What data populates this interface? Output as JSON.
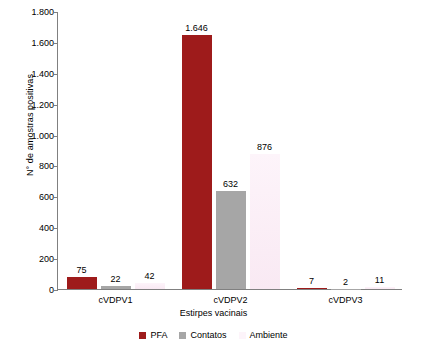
{
  "chart_data": {
    "type": "bar",
    "title": "",
    "xlabel": "Estirpes vacinais",
    "ylabel": "N° de amostras positivas",
    "categories": [
      "cVDPV1",
      "cVDPV2",
      "cVDPV3"
    ],
    "series": [
      {
        "name": "PFA",
        "color": "#9E1B1B",
        "values": [
          75,
          1646,
          7
        ],
        "labels": [
          "75",
          "1.646",
          "7"
        ]
      },
      {
        "name": "Contatos",
        "color": "#A6A6A6",
        "values": [
          22,
          632,
          2
        ],
        "labels": [
          "22",
          "632",
          "2"
        ]
      },
      {
        "name": "Ambiente",
        "color": "#FBEFF7",
        "values": [
          42,
          876,
          11
        ],
        "labels": [
          "42",
          "876",
          "11"
        ]
      }
    ],
    "ylim": [
      0,
      1800
    ],
    "yticks": [
      0,
      200,
      400,
      600,
      800,
      1000,
      1200,
      1400,
      1600,
      1800
    ],
    "ytick_labels": [
      "0",
      "200",
      "400",
      "600",
      "800",
      "1.000",
      "1.200",
      "1.400",
      "1.600",
      "1.800"
    ],
    "grid": false,
    "legend_position": "bottom"
  },
  "legend": {
    "items": [
      {
        "label": "PFA",
        "color": "#9E1B1B"
      },
      {
        "label": "Contatos",
        "color": "#A6A6A6"
      },
      {
        "label": "Ambiente",
        "color": "#FBEFF7"
      }
    ]
  }
}
